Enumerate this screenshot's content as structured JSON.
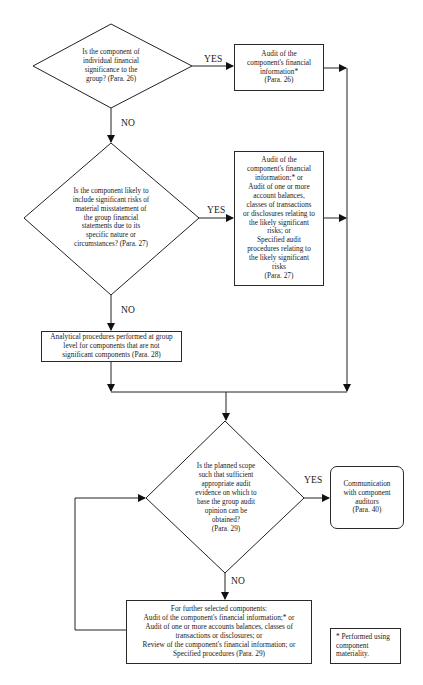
{
  "diagram": {
    "type": "flowchart",
    "decisions": [
      {
        "id": "d1",
        "text": "Is the component of\nindividual financial\nsignificance to the\ngroup? (Para. 26)"
      },
      {
        "id": "d2",
        "text": "Is the component likely to\ninclude significant risks of\nmaterial misstatement of\nthe group financial\nstatements due to its\nspecific nature or\ncircumstances? (Para. 27)"
      },
      {
        "id": "d3",
        "text": "Is the planned scope\nsuch that sufficient\nappropriate audit\nevidence on which to\nbase the group audit\nopinion can be\nobtained?\n(Para. 29)"
      }
    ],
    "processes": [
      {
        "id": "p1",
        "text": "Audit of the\ncomponent's financial\ninformation*\n(Para. 26)"
      },
      {
        "id": "p2",
        "text": "Audit of the\ncomponent's financial\ninformation;* or\nAudit of one or more\naccount balances,\nclasses of transactions\nor disclosures relating to\nthe likely significant\nrisks; or\nSpecified audit\nprocedures relating to\nthe likely significant\nrisks\n(Para. 27)"
      },
      {
        "id": "p3",
        "text": "Analytical procedures performed at group\nlevel for components that are not\nsignificant components (Para. 28)"
      },
      {
        "id": "p4",
        "text": "For further selected components:\nAudit of the component's financial information;* or\nAudit of one or more accounts balances, classes of\ntransactions or disclosures; or\nReview of the component's financial information; or\nSpecified procedures (Para. 29)"
      }
    ],
    "terminal": {
      "id": "t1",
      "text": "Communication\nwith component\nauditors\n(Para. 40)"
    },
    "footnote": {
      "text": "* Performed using\ncomponent\nmateriality."
    },
    "edge_labels": {
      "d1_yes": "YES",
      "d1_no": "NO",
      "d2_yes": "YES",
      "d2_no": "NO",
      "d3_yes": "YES",
      "d3_no": "NO"
    },
    "edges": [
      {
        "from": "d1",
        "to": "p1",
        "label": "YES"
      },
      {
        "from": "d1",
        "to": "d2",
        "label": "NO"
      },
      {
        "from": "d2",
        "to": "p2",
        "label": "YES"
      },
      {
        "from": "d2",
        "to": "p3",
        "label": "NO"
      },
      {
        "from": "p1",
        "to": "d3"
      },
      {
        "from": "p2",
        "to": "d3"
      },
      {
        "from": "p3",
        "to": "d3"
      },
      {
        "from": "d3",
        "to": "t1",
        "label": "YES"
      },
      {
        "from": "d3",
        "to": "p4",
        "label": "NO"
      },
      {
        "from": "p4",
        "to": "d3"
      }
    ]
  }
}
